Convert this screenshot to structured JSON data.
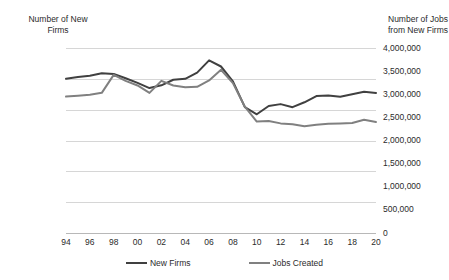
{
  "chart_data": {
    "type": "line",
    "title": "",
    "xlabel": "",
    "grid": "horizontal",
    "legend_position": "bottom",
    "x": [
      1994,
      1995,
      1996,
      1997,
      1998,
      1999,
      2000,
      2001,
      2002,
      2003,
      2004,
      2005,
      2006,
      2007,
      2008,
      2009,
      2010,
      2011,
      2012,
      2013,
      2014,
      2015,
      2016,
      2017,
      2018,
      2019,
      2020
    ],
    "x_tick_labels": [
      "94",
      "96",
      "98",
      "00",
      "02",
      "04",
      "06",
      "08",
      "10",
      "12",
      "14",
      "16",
      "18",
      "20"
    ],
    "x_tick_values": [
      1994,
      1996,
      1998,
      2000,
      2002,
      2004,
      2006,
      2008,
      2010,
      2012,
      2014,
      2016,
      2018,
      2020
    ],
    "axes": {
      "left": {
        "label": "Number of New\nFirms",
        "ticks": [
          "0",
          "100,000",
          "200,000",
          "300,000",
          "400,000",
          "500,000",
          "600,000"
        ],
        "tick_values": [
          0,
          100000,
          200000,
          300000,
          400000,
          500000,
          600000
        ],
        "min": 0,
        "max": 600000
      },
      "right": {
        "label": "Number of Jobs\nfrom New Firms",
        "ticks": [
          "0",
          "500,000",
          "1,000,000",
          "1,500,000",
          "2,000,000",
          "2,500,000",
          "3,000,000",
          "3,500,000",
          "4,000,000"
        ],
        "tick_values": [
          0,
          500000,
          1000000,
          1500000,
          2000000,
          2500000,
          3000000,
          3500000,
          4000000
        ],
        "min": 0,
        "max": 4000000
      }
    },
    "series": [
      {
        "name": "New Firms",
        "axis": "left",
        "color": "#404040",
        "values": [
          500000,
          506000,
          510000,
          518000,
          516000,
          502000,
          487000,
          470000,
          479000,
          497000,
          500000,
          520000,
          560000,
          540000,
          492000,
          408000,
          385000,
          412000,
          418000,
          408000,
          424000,
          444000,
          446000,
          442000,
          450000,
          458000,
          454000
        ]
      },
      {
        "name": "Jobs Created",
        "axis": "right",
        "color": "#808080",
        "values": [
          2950000,
          2970000,
          2990000,
          3030000,
          3420000,
          3290000,
          3190000,
          3030000,
          3290000,
          3190000,
          3150000,
          3160000,
          3300000,
          3530000,
          3240000,
          2730000,
          2410000,
          2420000,
          2370000,
          2350000,
          2310000,
          2340000,
          2360000,
          2370000,
          2380000,
          2450000,
          2400000
        ]
      }
    ]
  },
  "legend": {
    "items": [
      {
        "label": "New Firms",
        "color": "#404040"
      },
      {
        "label": "Jobs Created",
        "color": "#808080"
      }
    ]
  }
}
